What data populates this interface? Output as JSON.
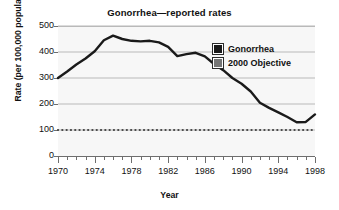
{
  "chart_data": {
    "type": "line",
    "title": "Gonorrhea—reported rates",
    "xlabel": "Year",
    "ylabel": "Rate (per 100,000 population)",
    "xlim": [
      1970,
      1998
    ],
    "ylim": [
      0,
      500
    ],
    "grid": true,
    "legend_position": "inside-top-right",
    "x_tick_labels": [
      "1970",
      "1974",
      "1978",
      "1982",
      "1986",
      "1990",
      "1994",
      "1998"
    ],
    "x_major_ticks": [
      1970,
      1974,
      1978,
      1982,
      1986,
      1990,
      1994,
      1998
    ],
    "x_minor_tick_interval": 1,
    "y_tick_labels": [
      "0",
      "100",
      "200",
      "300",
      "400",
      "500"
    ],
    "y_ticks": [
      0,
      100,
      200,
      300,
      400,
      500
    ],
    "x": [
      1970,
      1971,
      1972,
      1973,
      1974,
      1975,
      1976,
      1977,
      1978,
      1979,
      1980,
      1981,
      1982,
      1983,
      1984,
      1985,
      1986,
      1987,
      1988,
      1989,
      1990,
      1991,
      1992,
      1993,
      1994,
      1995,
      1996,
      1997,
      1998
    ],
    "series": [
      {
        "name": "Gonorrhea",
        "color": "#1a1a1a",
        "style": "solid",
        "values": [
          300,
          325,
          352,
          375,
          403,
          445,
          463,
          450,
          443,
          441,
          443,
          437,
          420,
          384,
          392,
          397,
          383,
          354,
          330,
          300,
          278,
          248,
          205,
          185,
          168,
          150,
          130,
          131,
          160
        ]
      },
      {
        "name": "2000 Objective",
        "color": "#444444",
        "style": "dotted",
        "constant_value": 100,
        "values": [
          100,
          100,
          100,
          100,
          100,
          100,
          100,
          100,
          100,
          100,
          100,
          100,
          100,
          100,
          100,
          100,
          100,
          100,
          100,
          100,
          100,
          100,
          100,
          100,
          100,
          100,
          100,
          100,
          100
        ]
      }
    ],
    "legend": [
      {
        "label": "Gonorrhea",
        "color": "#1a1a1a"
      },
      {
        "label": "2000 Objective",
        "color": "#767676"
      }
    ]
  },
  "colors": {
    "plot_background": "#f7f7f7",
    "gridline": "#b9b9b9",
    "axis": "#6e6e6e",
    "series_primary": "#1a1a1a",
    "series_objective": "#767676",
    "page_background": "#ffffff"
  }
}
